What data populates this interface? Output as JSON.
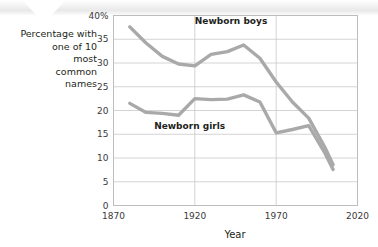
{
  "chart_data": {
    "type": "line",
    "title": "",
    "xlabel": "Year",
    "ylabel": "Percentage with one of 10 most common names",
    "ylabel_lines": [
      "Percentage with",
      "one of 10",
      "most",
      "common",
      "names"
    ],
    "xlim": [
      1870,
      2020
    ],
    "ylim": [
      0,
      40
    ],
    "grid": true,
    "legend_position": "inline-annotation",
    "xticks": [
      1870,
      1920,
      1970,
      2020
    ],
    "xtick_labels": [
      "1870",
      "1920",
      "1970",
      "2020"
    ],
    "yticks": [
      0,
      5,
      10,
      15,
      20,
      25,
      30,
      35,
      40
    ],
    "ytick_labels": [
      "0",
      "5",
      "10",
      "15",
      "20",
      "25",
      "30",
      "35",
      "40%"
    ],
    "series": [
      {
        "name": "Newborn boys",
        "color": "#a9a9a9",
        "label_x": 1920,
        "label_y": 38.2,
        "x": [
          1880,
          1890,
          1900,
          1910,
          1920,
          1930,
          1940,
          1950,
          1960,
          1970,
          1980,
          1990,
          2000,
          2005
        ],
        "values": [
          37.6,
          34.2,
          31.4,
          29.8,
          29.4,
          31.8,
          32.4,
          33.8,
          31.0,
          26.0,
          21.8,
          18.4,
          12.2,
          8.6
        ]
      },
      {
        "name": "Newborn girls",
        "color": "#a9a9a9",
        "label_x": 1895,
        "label_y": 16.2,
        "x": [
          1880,
          1890,
          1900,
          1910,
          1920,
          1930,
          1940,
          1950,
          1960,
          1970,
          1980,
          1990,
          2000,
          2005
        ],
        "values": [
          21.5,
          19.6,
          19.4,
          19.0,
          22.5,
          22.3,
          22.4,
          23.3,
          21.8,
          15.3,
          16.0,
          16.8,
          11.0,
          7.6
        ]
      }
    ]
  },
  "axis_caption": {
    "l1": "Percentage with",
    "l2": "one of 10",
    "l3": "most",
    "l4": "common",
    "l5": "names"
  },
  "x_axis_title": "Year",
  "series_labels": {
    "boys": "Newborn boys",
    "girls": "Newborn girls"
  },
  "tick_text": {
    "y40": "40%",
    "y35": "35",
    "y30": "30",
    "y25": "25",
    "y20": "20",
    "y15": "15",
    "y10": "10",
    "y5": "5",
    "y0": "0",
    "x1870": "1870",
    "x1920": "1920",
    "x1970": "1970",
    "x2020": "2020"
  },
  "colors": {
    "line": "#a9a9a9",
    "grid": "#c9c9c9",
    "frame": "#bdbdbd",
    "text": "#231f20"
  }
}
